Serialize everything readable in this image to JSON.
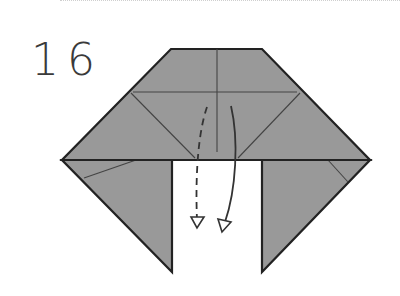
{
  "step": {
    "number": "16"
  },
  "colors": {
    "paper": "#999999",
    "outline": "#222222",
    "crease": "#444444",
    "background": "#ffffff"
  },
  "diagram": {
    "arrows": [
      {
        "style": "dashed",
        "meaning": "fold behind / hidden layer down"
      },
      {
        "style": "solid",
        "meaning": "fold front layer down"
      }
    ]
  }
}
